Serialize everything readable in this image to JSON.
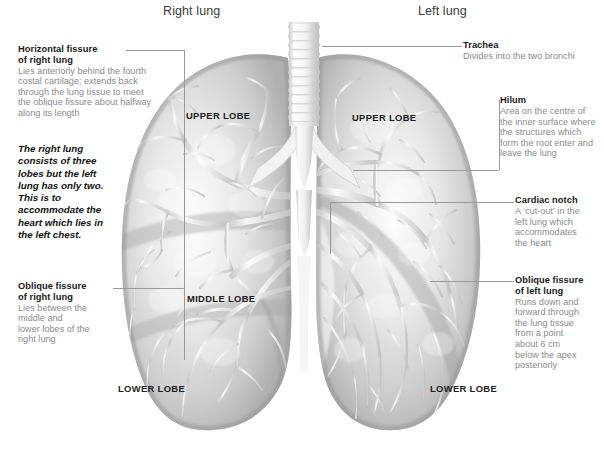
{
  "figure": {
    "background_color": "#ffffff",
    "line_color": "#9a9a9a",
    "heading_color": "#3a3a3a",
    "body_text_color": "#8b8b8b",
    "label_color": "#1a1a1a"
  },
  "headers": {
    "right": "Right lung",
    "left": "Left lung"
  },
  "lobes": {
    "right_upper": "UPPER LOBE",
    "right_middle": "MIDDLE LOBE",
    "right_lower": "LOWER LOBE",
    "left_upper": "UPPER LOBE",
    "left_lower": "LOWER LOBE"
  },
  "emphasis": "The right lung\nconsists of three\nlobes but the left\nlung has only two.\nThis is to\naccommodate the\nheart which lies in\nthe left chest.",
  "notes": {
    "horizontal_fissure": {
      "title": "Horizontal fissure\nof right lung",
      "body": "Lies anteriorly behind the fourth\ncostal cartilage; extends back\nthrough the lung tissue to meet\nthe oblique fissure about halfway\nalong its length"
    },
    "oblique_fissure_right": {
      "title": "Oblique fissure\nof right lung",
      "body": "Lies between the\nmiddle and\nlower lobes of the\nright lung"
    },
    "trachea": {
      "title": "Trachea",
      "body": "Divides into the two bronchi"
    },
    "hilum": {
      "title": "Hilum",
      "body": "Area on the centre of\nthe inner surface where\nthe structures which\nform the root enter and\nleave the lung"
    },
    "cardiac_notch": {
      "title": "Cardiac notch",
      "body": "A ‘cut-out’ in the\nleft lung which\naccommodates\nthe heart"
    },
    "oblique_fissure_left": {
      "title": "Oblique fissure\nof left lung",
      "body": "Runs down and\nforward through\nthe lung tissue\nfrom a point\nabout 6 cm\nbelow the apex\nposteriorly"
    }
  }
}
